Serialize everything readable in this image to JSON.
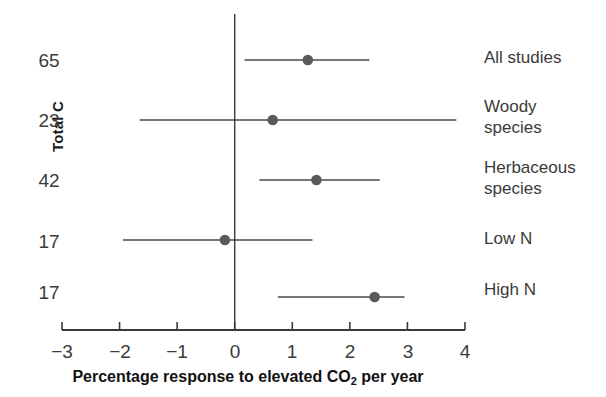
{
  "chart_data": {
    "type": "scatter",
    "title": "",
    "xlabel": "Percentage response to elevated CO2 per year",
    "ylabel": "Total C",
    "xlim": [
      -3,
      4
    ],
    "xticks": [
      -3,
      -2,
      -1,
      0,
      1,
      2,
      3,
      4
    ],
    "xticklabels": [
      "−3",
      "−2",
      "−1",
      "0",
      "1",
      "2",
      "3",
      "4"
    ],
    "grid": false,
    "legend": "none",
    "reference_line_x": 0,
    "categories": [
      "All studies",
      "Woody species",
      "Herbaceous species",
      "Low N",
      "High N"
    ],
    "counts": [
      65,
      23,
      42,
      17,
      17
    ],
    "values": [
      1.27,
      0.66,
      1.42,
      -0.17,
      2.43
    ],
    "ci_low": [
      0.17,
      -1.65,
      0.43,
      -1.94,
      0.75
    ],
    "ci_high": [
      2.34,
      3.85,
      2.52,
      1.35,
      2.95
    ],
    "points": [
      {
        "label": "All studies",
        "count": 65,
        "mean": 1.27,
        "low": 0.17,
        "high": 2.34
      },
      {
        "label": "Woody species",
        "count": 23,
        "mean": 0.66,
        "low": -1.65,
        "high": 3.85
      },
      {
        "label": "Herbaceous species",
        "count": 42,
        "mean": 1.42,
        "low": 0.43,
        "high": 2.52
      },
      {
        "label": "Low N",
        "count": 17,
        "mean": -0.17,
        "low": -1.94,
        "high": 1.35
      },
      {
        "label": "High N",
        "count": 17,
        "mean": 2.43,
        "low": 0.75,
        "high": 2.95
      }
    ],
    "marker_color": "#5a5a5a",
    "line_color": "#4a4a4a",
    "axis_color": "#3a3a3a"
  },
  "axis": {
    "y_title": "Total C",
    "x_title_prefix": "Percentage response to elevated CO",
    "x_title_sub": "2",
    "x_title_suffix": " per year",
    "ticks": [
      {
        "value": -3,
        "label": "−3"
      },
      {
        "value": -2,
        "label": "−2"
      },
      {
        "value": -1,
        "label": "−1"
      },
      {
        "value": 0,
        "label": "0"
      },
      {
        "value": 1,
        "label": "1"
      },
      {
        "value": 2,
        "label": "2"
      },
      {
        "value": 3,
        "label": "3"
      },
      {
        "value": 4,
        "label": "4"
      }
    ]
  },
  "rows": [
    {
      "count": "65",
      "label": "All studies"
    },
    {
      "count": "23",
      "label": "Woody\nspecies"
    },
    {
      "count": "42",
      "label": "Herbaceous\nspecies"
    },
    {
      "count": "17",
      "label": "Low N"
    },
    {
      "count": "17",
      "label": "High N"
    }
  ]
}
